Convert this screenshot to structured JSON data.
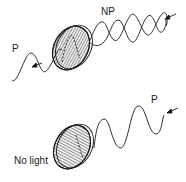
{
  "diagram": {
    "top_panel": {
      "label_unpolarized": "NP",
      "label_polarized": "P",
      "polarizer_hatching": "vertical"
    },
    "bottom_panel": {
      "label_polarized": "P",
      "label_result": "No light",
      "polarizer_hatching": "horizontal"
    },
    "colors": {
      "stroke": "#1a1a1a",
      "background": "#ffffff"
    }
  }
}
